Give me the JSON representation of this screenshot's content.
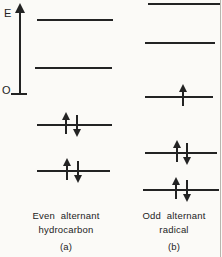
{
  "figure": {
    "axis": {
      "label": "E",
      "origin_label": "O"
    },
    "columns": [
      {
        "name": "even-alternant-hydrocarbon",
        "caption": [
          "Even alternant",
          "hydrocarbon",
          "(a)"
        ],
        "levels": [
          {
            "y": 19,
            "x1": 37,
            "x2": 113,
            "electrons": []
          },
          {
            "y": 67,
            "x1": 35,
            "x2": 112,
            "electrons": []
          },
          {
            "y": 124,
            "x1": 37,
            "x2": 112,
            "electrons": [
              {
                "dir": "up",
                "x": 66
              },
              {
                "dir": "down",
                "x": 77
              }
            ]
          },
          {
            "y": 170,
            "x1": 37,
            "x2": 110,
            "electrons": [
              {
                "dir": "up",
                "x": 67
              },
              {
                "dir": "down",
                "x": 78
              }
            ]
          }
        ]
      },
      {
        "name": "odd-alternant-radical",
        "caption": [
          "Odd alternant",
          "radical",
          "(b)"
        ],
        "levels": [
          {
            "y": 3,
            "x1": 148,
            "x2": 220,
            "electrons": []
          },
          {
            "y": 42,
            "x1": 145,
            "x2": 215,
            "electrons": []
          },
          {
            "y": 96,
            "x1": 145,
            "x2": 213,
            "electrons": [
              {
                "dir": "up",
                "x": 183
              }
            ]
          },
          {
            "y": 152,
            "x1": 145,
            "x2": 217,
            "electrons": [
              {
                "dir": "up",
                "x": 177
              },
              {
                "dir": "down",
                "x": 187
              }
            ]
          },
          {
            "y": 189,
            "x1": 143,
            "x2": 219,
            "electrons": [
              {
                "dir": "up",
                "x": 176
              },
              {
                "dir": "down",
                "x": 187
              }
            ]
          }
        ]
      }
    ],
    "colors": {
      "ink": "#232323",
      "paper": "#fbfaf7",
      "edge_line": "#9b978f"
    }
  }
}
